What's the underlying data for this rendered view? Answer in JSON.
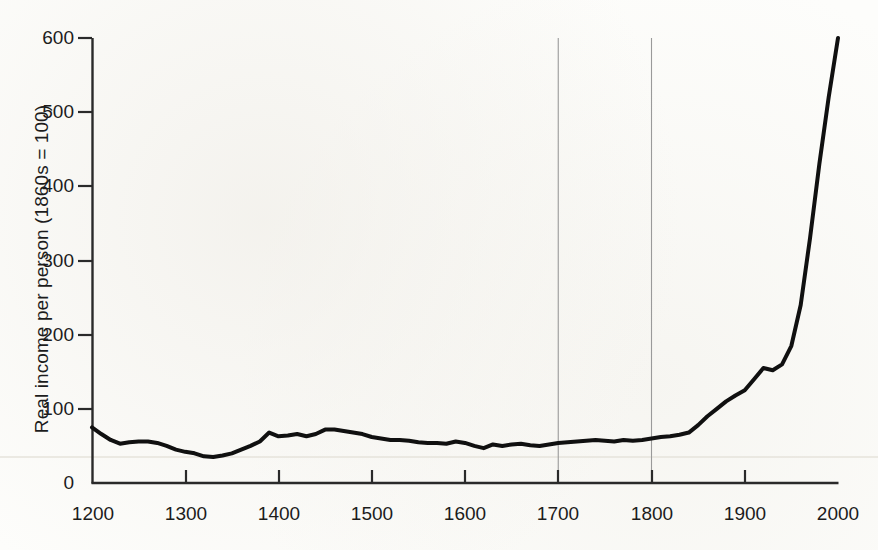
{
  "chart_data": {
    "type": "line",
    "title": "",
    "subtitle": "",
    "xlabel": "",
    "ylabel": "Real income per person (1860s = 100)",
    "xlim": [
      1200,
      2000
    ],
    "ylim": [
      0,
      600
    ],
    "grid": false,
    "legend": null,
    "legend_position": "none",
    "x_ticks": [
      1200,
      1300,
      1400,
      1500,
      1600,
      1700,
      1800,
      1900,
      2000
    ],
    "x_tick_labels": [
      "1200",
      "1300",
      "1400",
      "1500",
      "1600",
      "1700",
      "1800",
      "1900",
      "2000"
    ],
    "y_ticks": [
      0,
      100,
      200,
      300,
      400,
      500,
      600
    ],
    "y_tick_labels": [
      "0",
      "100",
      "200",
      "300",
      "400",
      "500",
      "600"
    ],
    "annotations": [
      {
        "name": "reference-line-1700",
        "type": "vline",
        "x": 1700,
        "color": "#9a9a9a"
      },
      {
        "name": "reference-line-1800",
        "type": "vline",
        "x": 1800,
        "color": "#9a9a9a"
      }
    ],
    "series": [
      {
        "name": "Real income per person",
        "color": "#101010",
        "line_width": 4,
        "x": [
          1200,
          1210,
          1220,
          1230,
          1240,
          1250,
          1260,
          1270,
          1280,
          1290,
          1300,
          1310,
          1320,
          1330,
          1340,
          1350,
          1360,
          1370,
          1380,
          1390,
          1400,
          1410,
          1420,
          1430,
          1440,
          1450,
          1460,
          1470,
          1480,
          1490,
          1500,
          1510,
          1520,
          1530,
          1540,
          1550,
          1560,
          1570,
          1580,
          1590,
          1600,
          1610,
          1620,
          1630,
          1640,
          1650,
          1660,
          1670,
          1680,
          1690,
          1700,
          1710,
          1720,
          1730,
          1740,
          1750,
          1760,
          1770,
          1780,
          1790,
          1800,
          1810,
          1820,
          1830,
          1840,
          1850,
          1860,
          1870,
          1880,
          1890,
          1900,
          1910,
          1920,
          1930,
          1940,
          1950,
          1960,
          1970,
          1980,
          1990,
          2000
        ],
        "values": [
          75,
          66,
          58,
          53,
          55,
          56,
          56,
          54,
          50,
          45,
          42,
          40,
          36,
          35,
          37,
          40,
          45,
          50,
          56,
          68,
          63,
          64,
          66,
          63,
          66,
          72,
          72,
          70,
          68,
          66,
          62,
          60,
          58,
          58,
          57,
          55,
          54,
          54,
          53,
          56,
          54,
          50,
          47,
          52,
          50,
          52,
          53,
          51,
          50,
          52,
          54,
          55,
          56,
          57,
          58,
          57,
          56,
          58,
          57,
          58,
          60,
          62,
          63,
          65,
          68,
          78,
          90,
          100,
          110,
          118,
          125,
          140,
          155,
          152,
          160,
          185,
          240,
          330,
          430,
          520,
          600
        ]
      }
    ]
  },
  "axis": {
    "y_label": "Real income per person (1860s = 100)",
    "y_tick_labels": [
      "600",
      "500",
      "400",
      "300",
      "200",
      "100",
      "0"
    ],
    "x_tick_labels": [
      "1200",
      "1300",
      "1400",
      "1500",
      "1600",
      "1700",
      "1800",
      "1900",
      "2000"
    ]
  },
  "colors": {
    "line": "#101010",
    "axis": "#2a2a2a",
    "reference_line": "#9a9a9a",
    "baseline_hint": "#e3e0d8",
    "background": "#fdfdfb",
    "text": "#1c1c1c"
  }
}
